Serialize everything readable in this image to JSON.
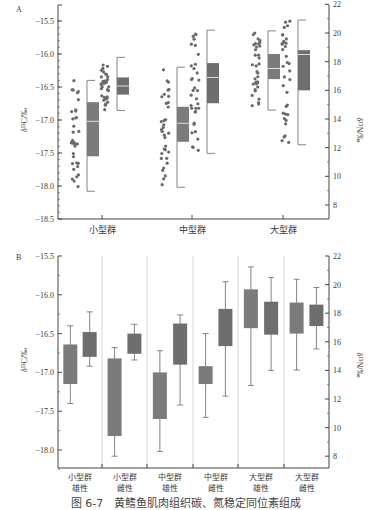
{
  "caption": "图 6-7　黄鳍鱼肌肉组织碳、氮稳定同位素组成",
  "colors": {
    "box_c": "#7b7b7b",
    "box_n": "#6e6e6e",
    "points": "#6a6a6a",
    "axis": "#444444",
    "median_line": "#dddddd",
    "divider": "#bbbbbb"
  },
  "chart_data": [
    {
      "panel": "A",
      "type": "box+scatter",
      "panel_label": "A",
      "categories": [
        "小型群",
        "中型群",
        "大型群"
      ],
      "ylabel_left": "δ¹³C/‰",
      "ylabel_right": "δ¹⁵N/‰",
      "ylim_left": [
        -18.5,
        -15.5
      ],
      "ylim_right": [
        8,
        22
      ],
      "yticks_left": [
        "-15.5",
        "-16.0",
        "-16.5",
        "-17.0",
        "-17.5",
        "-18.0",
        "-18.5"
      ],
      "yticks_right": [
        "22",
        "20",
        "18",
        "16",
        "14",
        "12",
        "10",
        "8"
      ],
      "series": [
        {
          "name": "δ13C",
          "axis": "left",
          "boxes": [
            {
              "category": "小型群",
              "whisker_low": -18.08,
              "q1": -17.55,
              "median": -17.02,
              "q3": -16.73,
              "whisker_high": -16.4
            },
            {
              "category": "中型群",
              "whisker_low": -18.02,
              "q1": -17.33,
              "median": -17.05,
              "q3": -16.8,
              "whisker_high": -16.2
            },
            {
              "category": "大型群",
              "whisker_low": -16.85,
              "q1": -16.38,
              "median": -16.22,
              "q3": -16.0,
              "whisker_high": -15.65
            }
          ]
        },
        {
          "name": "δ15N",
          "axis": "right",
          "boxes": [
            {
              "category": "小型群",
              "whisker_low": 14.6,
              "q1": 15.7,
              "median": 16.3,
              "q3": 16.9,
              "whisker_high": 18.3
            },
            {
              "category": "中型群",
              "whisker_low": 11.6,
              "q1": 15.1,
              "median": 16.9,
              "q3": 17.9,
              "whisker_high": 20.2
            },
            {
              "category": "大型群",
              "whisker_low": 12.2,
              "q1": 16.0,
              "median": 18.5,
              "q3": 18.8,
              "whisker_high": 20.9
            }
          ]
        }
      ]
    },
    {
      "panel": "B",
      "type": "box",
      "panel_label": "B",
      "categories": [
        "小型群\n雄性",
        "小型群\n雌性",
        "中型群\n雄性",
        "中型群\n雌性",
        "大型群\n雄性",
        "大型群\n雌性"
      ],
      "category_lines": [
        [
          "小型群",
          "雄性"
        ],
        [
          "小型群",
          "雌性"
        ],
        [
          "中型群",
          "雄性"
        ],
        [
          "中型群",
          "雌性"
        ],
        [
          "大型群",
          "雄性"
        ],
        [
          "大型群",
          "雌性"
        ]
      ],
      "ylabel_left": "δ¹³C/‰",
      "ylabel_right": "δ¹⁵N/‰",
      "ylim_left": [
        -18.25,
        -15.5
      ],
      "ylim_right": [
        7,
        22
      ],
      "yticks_left": [
        "-15.5",
        "-16.0",
        "-16.5",
        "-17.0",
        "-17.5",
        "-18.0"
      ],
      "yticks_right": [
        "22",
        "20",
        "18",
        "16",
        "14",
        "12",
        "10",
        "8"
      ],
      "series": [
        {
          "name": "δ13C",
          "axis": "left",
          "boxes": [
            {
              "category": "小型群雄性",
              "whisker_low": -17.4,
              "q1": -17.15,
              "q3": -16.64,
              "whisker_high": -16.4
            },
            {
              "category": "小型群雌性",
              "whisker_low": -18.08,
              "q1": -17.82,
              "q3": -16.82,
              "whisker_high": -16.68
            },
            {
              "category": "中型群雄性",
              "whisker_low": -18.02,
              "q1": -17.6,
              "q3": -17.0,
              "whisker_high": -16.72
            },
            {
              "category": "中型群雌性",
              "whisker_low": -17.58,
              "q1": -17.15,
              "q3": -16.92,
              "whisker_high": -16.5
            },
            {
              "category": "大型群雄性",
              "whisker_low": -17.17,
              "q1": -16.43,
              "q3": -15.93,
              "whisker_high": -15.64
            },
            {
              "category": "大型群雌性",
              "whisker_low": -16.97,
              "q1": -16.5,
              "q3": -16.1,
              "whisker_high": -15.8
            }
          ]
        },
        {
          "name": "δ15N",
          "axis": "right",
          "boxes": [
            {
              "category": "小型群雄性",
              "whisker_low": 15.4,
              "q1": 16.2,
              "q3": 17.0,
              "whisker_high": 18.0
            },
            {
              "category": "小型群雌性",
              "whisker_low": 15.6,
              "q1": 16.4,
              "q3": 17.0,
              "whisker_high": 17.6
            },
            {
              "category": "中型群雄性",
              "whisker_low": 10.7,
              "q1": 13.0,
              "q3": 15.1,
              "whisker_high": 18.2
            },
            {
              "category": "中型群雌性",
              "whisker_low": 12.2,
              "q1": 15.7,
              "q3": 18.3,
              "whisker_high": 20.2
            },
            {
              "category": "大型群雄性",
              "whisker_low": 12.9,
              "q1": 16.4,
              "q3": 19.7,
              "whisker_high": 21.4
            },
            {
              "category": "大型群雌性",
              "whisker_low": 14.0,
              "q1": 16.5,
              "q3": 18.8,
              "whisker_high": 20.5
            },
            {
              "category": "大型群雌性-extra",
              "note": "sixth group N box",
              "whisker_low": 15.5,
              "q1": 17.1,
              "q3": 18.6,
              "whisker_high": 19.8
            }
          ]
        }
      ]
    }
  ]
}
